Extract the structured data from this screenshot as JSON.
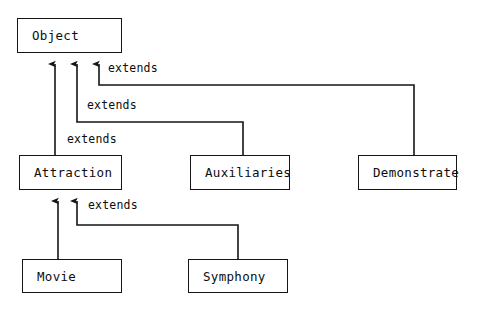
{
  "diagram": {
    "type": "class-inheritance-hierarchy",
    "background_color": "#ffffff",
    "line_color": "#151515",
    "text_color": "#0d0d0d",
    "nodes": [
      {
        "id": "object",
        "label": "Object",
        "x": 17,
        "y": 18,
        "w": 105,
        "h": 35,
        "level": 0
      },
      {
        "id": "attraction",
        "label": "Attraction",
        "x": 19,
        "y": 155,
        "w": 103,
        "h": 35,
        "level": 1
      },
      {
        "id": "auxiliaries",
        "label": "Auxiliaries",
        "x": 190,
        "y": 155,
        "w": 100,
        "h": 35,
        "level": 1
      },
      {
        "id": "demonstrate",
        "label": "Demonstrate",
        "x": 358,
        "y": 155,
        "w": 99,
        "h": 35,
        "level": 1
      },
      {
        "id": "movie",
        "label": "Movie",
        "x": 22,
        "y": 259,
        "w": 100,
        "h": 34,
        "level": 2
      },
      {
        "id": "symphony",
        "label": "Symphony",
        "x": 188,
        "y": 259,
        "w": 100,
        "h": 34,
        "level": 2
      }
    ],
    "edges": [
      {
        "from": "attraction",
        "to": "object",
        "label": "extends",
        "label_x": 66,
        "label_y": 132
      },
      {
        "from": "auxiliaries",
        "to": "object",
        "label": "extends",
        "label_x": 86,
        "label_y": 98
      },
      {
        "from": "demonstrate",
        "to": "object",
        "label": "extends",
        "label_x": 107,
        "label_y": 61
      },
      {
        "from": "symphony",
        "to": "attraction",
        "label": "extends",
        "label_x": 87,
        "label_y": 198
      },
      {
        "from": "movie",
        "to": "attraction",
        "label": "",
        "label_x": 0,
        "label_y": 0
      }
    ],
    "arrow_targets": {
      "object_arrow_x": [
        55,
        77,
        99
      ],
      "object_arrow_tip_y": 62,
      "attraction_arrow_x": [
        58,
        77
      ],
      "attraction_arrow_tip_y": 199
    }
  }
}
